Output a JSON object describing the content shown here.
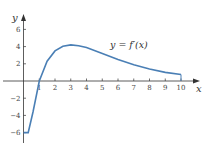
{
  "chart_data": {
    "type": "line",
    "title": "",
    "xlabel": "x",
    "ylabel": "y",
    "curve_label": "y = f′(x)",
    "xlim": [
      0,
      10.5
    ],
    "ylim": [
      -7,
      7
    ],
    "x_ticks": [
      1,
      2,
      3,
      4,
      5,
      6,
      7,
      8,
      9,
      10
    ],
    "y_ticks": [
      -6,
      -4,
      -2,
      2,
      4,
      6
    ],
    "grid": false,
    "series": [
      {
        "name": "f'(x)",
        "color": "#4a7fb5",
        "x": [
          0,
          0.3,
          0.6,
          1.0,
          1.5,
          2.0,
          2.5,
          3.0,
          3.5,
          4.0,
          5.0,
          6.0,
          7.0,
          8.0,
          9.0,
          10.0
        ],
        "y": [
          -6,
          -6,
          -3.6,
          0,
          2.3,
          3.5,
          4.05,
          4.2,
          4.1,
          3.9,
          3.2,
          2.5,
          1.9,
          1.4,
          1.0,
          0.75
        ]
      }
    ]
  }
}
